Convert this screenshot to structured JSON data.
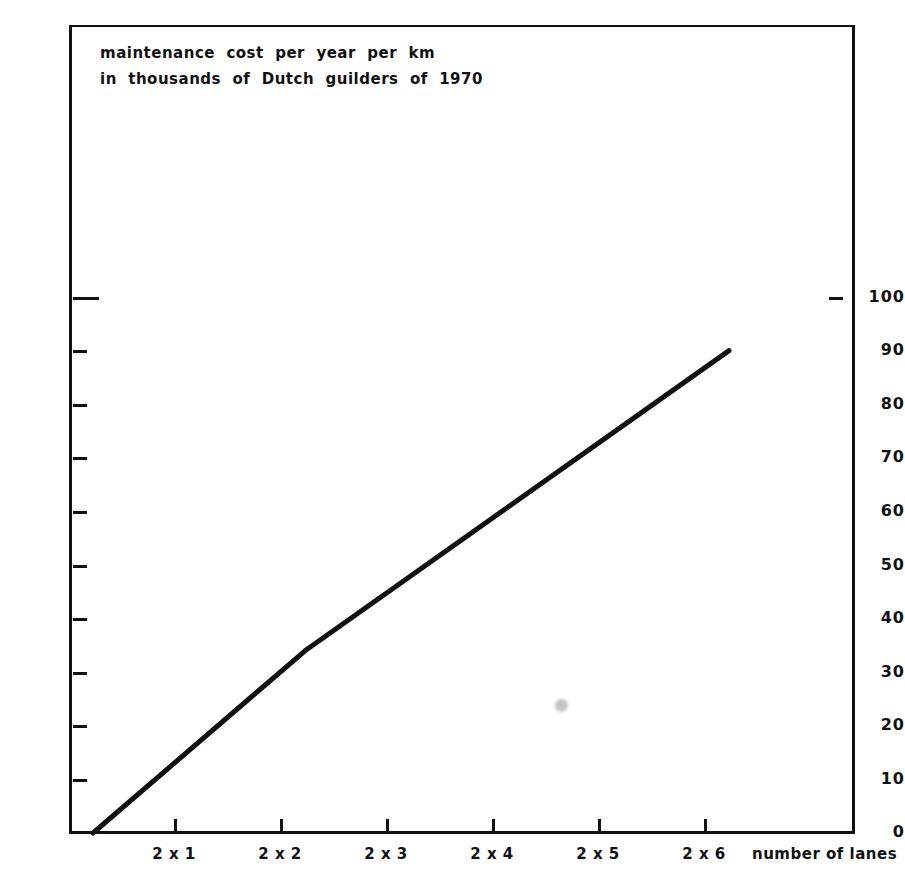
{
  "chart_data": {
    "type": "line",
    "title": "maintenance cost per year per km in thousands of Dutch guilders of 1970",
    "title_lines": [
      "maintenance  cost  per  year  per  km",
      "in  thousands  of  Dutch  guilders  of  1970"
    ],
    "xlabel": "number of lanes",
    "ylabel": "",
    "categories": [
      "2 x 1",
      "2 x 2",
      "2 x 3",
      "2 x 4",
      "2 x 5",
      "2 x 6"
    ],
    "x": [
      1,
      2,
      3,
      4,
      5,
      6
    ],
    "values": [
      17,
      34,
      48,
      62,
      76,
      90
    ],
    "points": [
      {
        "x": 0,
        "y": 0
      },
      {
        "x": 2,
        "y": 34
      },
      {
        "x": 6,
        "y": 90
      }
    ],
    "xlim": [
      0,
      7.42
    ],
    "ylim": [
      0,
      115
    ],
    "yticks": [
      0,
      10,
      20,
      30,
      40,
      50,
      60,
      70,
      80,
      90,
      100
    ],
    "ytick_labels": [
      "0",
      "10",
      "20",
      "30",
      "40",
      "50",
      "60",
      "70",
      "80",
      "90",
      "100"
    ],
    "xticks": [
      1,
      2,
      3,
      4,
      5,
      6
    ],
    "grid": false,
    "legend": null,
    "line_color": "#111111",
    "background": "#ffffff"
  },
  "axes": {
    "y_labels": [
      "100",
      "90",
      "80",
      "70",
      "60",
      "50",
      "40",
      "30",
      "20",
      "10",
      "0"
    ],
    "x_labels": [
      "2 x 1",
      "2 x 2",
      "2 x 3",
      "2 x 4",
      "2 x 5",
      "2 x 6"
    ],
    "x_axis_name": "number  of  lanes"
  },
  "colors": {
    "ink": "#111111",
    "paper": "#ffffff",
    "smudge": "#b9b9b9"
  }
}
